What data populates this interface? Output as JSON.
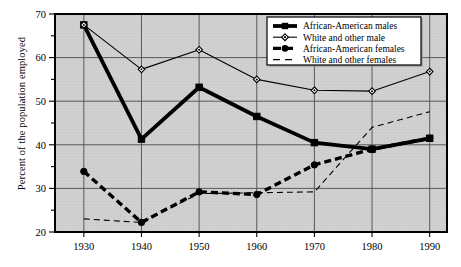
{
  "figure": {
    "background_color": "#ffffff",
    "plot_background_color": "#cfcfcf",
    "axis_color": "#000000",
    "grid_color": "#4d4d4d",
    "series_color": "#000000"
  },
  "axes": {
    "ylabel": "Percent of the population employed",
    "xlabel": "",
    "y_ticks": [
      "20",
      "30",
      "40",
      "50",
      "60",
      "70"
    ],
    "y_minor_ticks": [
      "25",
      "35",
      "45",
      "55",
      "65"
    ],
    "x_ticks": [
      "1930",
      "1940",
      "1950",
      "1960",
      "1970",
      "1980",
      "1990"
    ],
    "ylim_low": "20",
    "ylim_high": "70"
  },
  "legend": {
    "position": "top-right",
    "items": [
      {
        "label": "African-American males",
        "marker": "square-thick-solid"
      },
      {
        "label": "White and other male",
        "marker": "diamond-thin-solid"
      },
      {
        "label": "African-American females",
        "marker": "circle-thick-dashed"
      },
      {
        "label": "White and other females",
        "marker": "thin-dashed"
      }
    ]
  },
  "caption": {
    "text": ""
  },
  "chart_data": {
    "type": "line",
    "title": "",
    "xlabel": "",
    "ylabel": "Percent of the population employed",
    "x": [
      1930,
      1940,
      1950,
      1960,
      1970,
      1980,
      1990
    ],
    "xlim": [
      1925,
      1993
    ],
    "ylim": [
      20,
      70
    ],
    "grid": true,
    "legend_position": "top-right",
    "series": [
      {
        "name": "African-American males",
        "values": [
          67.5,
          41.3,
          53.2,
          46.5,
          40.5,
          39.0,
          41.5
        ],
        "style": "solid",
        "line_width": "thick",
        "marker": "square"
      },
      {
        "name": "White and other male",
        "values": [
          67.5,
          57.3,
          61.8,
          55.0,
          52.5,
          52.3,
          56.8
        ],
        "style": "solid",
        "line_width": "thin",
        "marker": "diamond"
      },
      {
        "name": "African-American females",
        "values": [
          33.9,
          22.2,
          29.2,
          28.6,
          35.4,
          39.0,
          41.5
        ],
        "style": "dashed",
        "line_width": "thick",
        "marker": "circle"
      },
      {
        "name": "White and other females",
        "values": [
          23.0,
          22.2,
          28.8,
          29.0,
          29.2,
          44.0,
          47.6
        ],
        "style": "dashed",
        "line_width": "thin",
        "marker": "none"
      }
    ]
  }
}
